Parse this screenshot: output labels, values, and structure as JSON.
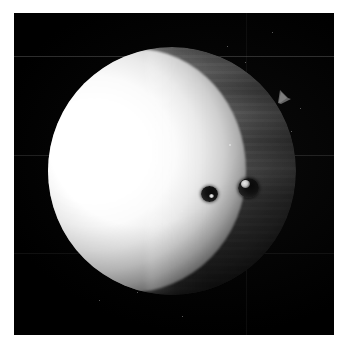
{
  "image": {
    "domain": "Natural-Image",
    "subject": "planet-disk-astronomical-photograph",
    "caption": "",
    "background_color": "#000000",
    "page_color": "#ffffff",
    "frame": {
      "left": 14,
      "top": 13,
      "width": 320,
      "height": 322
    }
  },
  "planet": {
    "name": "planet-disk",
    "disk": {
      "center_x": 158,
      "center_y": 158,
      "diameter": 248
    },
    "bright_crescent": {
      "name": "illuminated-limb",
      "side": "left",
      "color": "#ffffff",
      "description": "overexposed bright crescent"
    },
    "night_side": {
      "name": "banded-hemisphere",
      "side": "right",
      "color": "#4a4a4a",
      "description": "dark banded cloud hemisphere"
    },
    "limb_highlight_color": "#ebebeb",
    "terminator": {
      "name": "terminator",
      "description": "soft boundary between illuminated and shaded hemisphere"
    }
  },
  "features": {
    "spots": [
      {
        "name": "dark-spot-left",
        "x": 202,
        "y": 186,
        "width": 17,
        "height": 16,
        "color": "#111111",
        "highlight_color": "#f2f2f2"
      },
      {
        "name": "dark-spot-right",
        "x": 239,
        "y": 178,
        "width": 21,
        "height": 20,
        "color": "#111111",
        "highlight_color": "#f6f6f6"
      }
    ],
    "limb_notch": {
      "name": "limb-notch",
      "x": 278,
      "y": 88,
      "description": "small pointed protrusion on upper right limb"
    },
    "seam_lines": [
      {
        "name": "mosaic-seam-upper",
        "y": 56,
        "opacity": 0.3
      },
      {
        "name": "mosaic-seam-middle",
        "y": 155,
        "opacity": 0.22
      },
      {
        "name": "mosaic-seam-lower",
        "y": 253,
        "opacity": 0.14
      }
    ],
    "specks": [
      {
        "x": 272,
        "y": 32
      },
      {
        "x": 245,
        "y": 62
      },
      {
        "x": 300,
        "y": 108
      },
      {
        "x": 291,
        "y": 131
      },
      {
        "x": 147,
        "y": 210
      },
      {
        "x": 137,
        "y": 292
      },
      {
        "x": 99,
        "y": 300
      },
      {
        "x": 227,
        "y": 46
      },
      {
        "x": 196,
        "y": 135
      },
      {
        "x": 229,
        "y": 145
      }
    ]
  }
}
